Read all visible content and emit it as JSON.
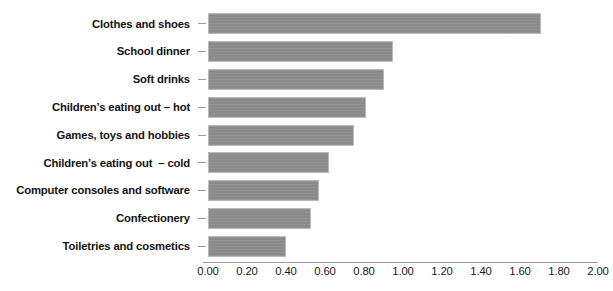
{
  "chart_data": {
    "type": "bar",
    "orientation": "horizontal",
    "title": "",
    "subtitle": "",
    "xlabel": "",
    "ylabel": "",
    "xlim": [
      0.0,
      2.0
    ],
    "xtick_step": 0.2,
    "grid": false,
    "legend": null,
    "bar_color": "#8e8e8e",
    "bar_border_color": "#b9b9b9",
    "axis_color": "#9a9a9a",
    "categories": [
      "Clothes and shoes",
      "School dinner",
      "Soft drinks",
      "Children’s eating out – hot",
      "Games, toys and hobbies",
      "Children’s eating out  – cold",
      "Computer consoles and software",
      "Confectionery",
      "Toiletries and cosmetics"
    ],
    "values": [
      1.71,
      0.95,
      0.9,
      0.81,
      0.75,
      0.62,
      0.57,
      0.53,
      0.4
    ],
    "xticklabels": [
      "0.00",
      "0.20",
      "0.40",
      "0.60",
      "0.80",
      "1.00",
      "1.20",
      "1.40",
      "1.60",
      "1.80",
      "2.00"
    ],
    "xtickvalues": [
      0.0,
      0.2,
      0.4,
      0.6,
      0.8,
      1.0,
      1.2,
      1.4,
      1.6,
      1.8,
      2.0
    ]
  }
}
